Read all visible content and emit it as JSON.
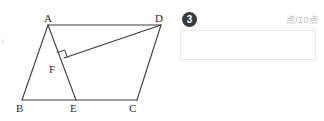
{
  "figure": {
    "vertex_labels": [
      {
        "id": "A",
        "text": "A",
        "x": 44,
        "y": 13
      },
      {
        "id": "D",
        "text": "D",
        "x": 155,
        "y": 13
      },
      {
        "id": "F",
        "text": "F",
        "x": 49,
        "y": 64
      },
      {
        "id": "B",
        "text": "B",
        "x": 16,
        "y": 103
      },
      {
        "id": "E",
        "text": "E",
        "x": 70,
        "y": 103
      },
      {
        "id": "C",
        "text": "C",
        "x": 129,
        "y": 103
      }
    ],
    "edge_mark": "▫",
    "points": {
      "A": {
        "x": 48,
        "y": 25
      },
      "B": {
        "x": 22,
        "y": 100
      },
      "C": {
        "x": 137,
        "y": 100
      },
      "D": {
        "x": 161,
        "y": 25
      },
      "E": {
        "x": 76,
        "y": 100
      },
      "F": {
        "x": 64,
        "y": 58
      }
    },
    "segments": [
      {
        "name": "AD",
        "from": "A",
        "to": "D"
      },
      {
        "name": "AB",
        "from": "A",
        "to": "B"
      },
      {
        "name": "BC",
        "from": "B",
        "to": "C"
      },
      {
        "name": "DC",
        "from": "D",
        "to": "C"
      },
      {
        "name": "AE",
        "from": "A",
        "to": "E"
      },
      {
        "name": "DF",
        "from": "D",
        "to": "F"
      }
    ],
    "right_angle_at": "F",
    "stroke_color": "#3c3c3c"
  },
  "answer_panel": {
    "badge_number": "3",
    "score_label": "点/10点",
    "input_value": "",
    "input_placeholder": ""
  }
}
